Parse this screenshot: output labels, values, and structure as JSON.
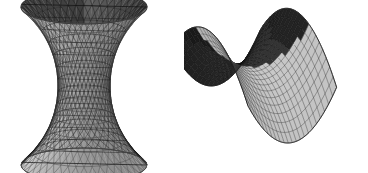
{
  "figure": {
    "background_color": "#ffffff",
    "width": 368,
    "height": 173,
    "panel_count": 2
  },
  "palette": {
    "background": "#ffffff",
    "facet_light": "#c4c4c4",
    "facet_mid": "#a8a8a8",
    "facet_dark": "#6e6e6e",
    "facet_shadow": "#3a3a3a",
    "facet_deep_shadow": "#1f1f1f",
    "mesh_line": "#5a5a5a",
    "mesh_line_dark": "#101010",
    "silhouette": "#2a2a2a"
  },
  "surfaces": [
    {
      "id": "hyperboloid",
      "name": "hyperboloid-of-one-sheet",
      "label": "Hyperboloid of one sheet",
      "equation": "x^2 + y^2 - z^2 = 1",
      "surface_type": "ruled-quadric",
      "render_style": "shaded-wireframe",
      "bounds": {
        "x": 18,
        "y": 6,
        "width": 132,
        "height": 160
      },
      "geometry": {
        "center_x": 84,
        "center_y": 86,
        "waist_radius_x": 26,
        "rim_radius_x": 63,
        "rim_radius_y": 17,
        "half_height": 79,
        "flare": 1.0,
        "u_segments": 40,
        "v_segments": 13
      },
      "shading": {
        "outer_light": "#cfcfcf",
        "outer_dark": "#8a8a8a",
        "inner_dark": "#262626",
        "inner_light": "#6a6a6a",
        "rim_edge": "#3c3c3c"
      },
      "features": [
        "elliptical top rim",
        "visible dark inner wall at top",
        "narrow circular waist",
        "flared bottom with contour rings",
        "diagonal ruled generator lines"
      ]
    },
    {
      "id": "saddle",
      "name": "hyperbolic-paraboloid",
      "label": "Hyperbolic paraboloid (saddle)",
      "equation": "z = x^2 - y^2",
      "surface_type": "ruled-quadric",
      "render_style": "shaded-wireframe",
      "bounds": {
        "x": 196,
        "y": 12,
        "width": 156,
        "height": 152
      },
      "geometry": {
        "origin_x": 70,
        "origin_y": 68,
        "scale_x": 54,
        "scale_y": 30,
        "scale_z": 46,
        "u_segments": 22,
        "v_segments": 22,
        "rotation_deg": -18,
        "tilt_deg": 26
      },
      "shading": {
        "front_light": "#bdbdbd",
        "front_mid": "#9d9d9d",
        "back_dark": "#343434",
        "crest_dark": "#161616",
        "valley_light": "#d2d2d2"
      },
      "features": [
        "two upward peaks (left lower, right taller)",
        "central saddle valley",
        "mesh converging at saddle point",
        "concave curved lower front edge",
        "dark shaded rear peak faces"
      ]
    }
  ]
}
